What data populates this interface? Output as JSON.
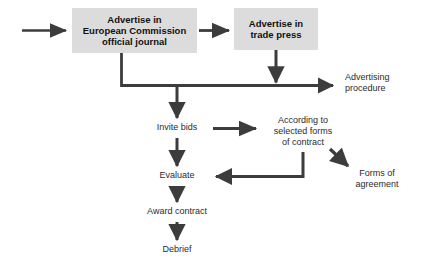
{
  "diagram": {
    "background_color": "#ffffff",
    "box_fill_color": "#dcdcdc",
    "line_color": "#3c3c3c",
    "text_color": "#2b2b2b",
    "box_text_color": "#111111"
  },
  "boxes": [
    {
      "id": "advertise-ec-journal",
      "lines": [
        "Advertise in",
        "European Commission",
        "official journal"
      ],
      "line1": "Advertise in",
      "line2": "European Commission",
      "line3": "official journal"
    },
    {
      "id": "advertise-trade-press",
      "lines": [
        "Advertise in",
        "trade press"
      ],
      "line1": "Advertise in",
      "line2": "trade press"
    }
  ],
  "labels": {
    "advertising_procedure": {
      "line1": "Advertising",
      "line2": "procedure"
    },
    "invite_bids": {
      "line1": "Invite bids"
    },
    "according_to_selected_forms": {
      "line1": "According to",
      "line2": "selected forms",
      "line3": "of contract"
    },
    "forms_of_agreement": {
      "line1": "Forms of",
      "line2": "agreement"
    },
    "evaluate": {
      "line1": "Evaluate"
    },
    "award_contract": {
      "line1": "Award contract"
    },
    "debrief": {
      "line1": "Debrief"
    }
  },
  "connectors": [
    {
      "id": "entry-arrow",
      "from": "entry",
      "to": "advertise-ec-journal",
      "direction": "right"
    },
    {
      "id": "ec-journal-to-trade-press",
      "from": "advertise-ec-journal",
      "to": "advertise-trade-press",
      "direction": "right"
    },
    {
      "id": "ec-journal-drop-to-trunk",
      "from": "advertise-ec-journal",
      "to": "advertising-trunk",
      "direction": "down"
    },
    {
      "id": "trade-press-drop-to-trunk",
      "from": "advertise-trade-press",
      "to": "advertising-trunk",
      "direction": "down"
    },
    {
      "id": "trunk-to-advertising-procedure",
      "from": "advertising-trunk",
      "to": "advertising_procedure",
      "direction": "right"
    },
    {
      "id": "trunk-to-invite-bids",
      "from": "advertising-trunk",
      "to": "invite_bids",
      "direction": "down"
    },
    {
      "id": "invite-bids-to-selected-forms",
      "from": "invite_bids",
      "to": "according_to_selected_forms",
      "direction": "right"
    },
    {
      "id": "selected-forms-to-forms-of-agreement",
      "from": "according_to_selected_forms",
      "to": "forms_of_agreement",
      "direction": "down-right"
    },
    {
      "id": "selected-forms-to-evaluate",
      "from": "according_to_selected_forms",
      "to": "evaluate",
      "direction": "left"
    },
    {
      "id": "invite-bids-to-evaluate",
      "from": "invite_bids",
      "to": "evaluate",
      "direction": "down"
    },
    {
      "id": "evaluate-to-award-contract",
      "from": "evaluate",
      "to": "award_contract",
      "direction": "down"
    },
    {
      "id": "award-contract-to-debrief",
      "from": "award_contract",
      "to": "debrief",
      "direction": "down"
    }
  ]
}
